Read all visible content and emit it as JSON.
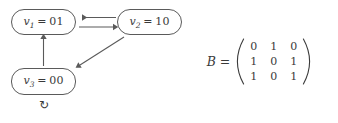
{
  "diagram": {
    "type": "state-transition-graph",
    "nodes": [
      {
        "id": "v1",
        "var": "v",
        "sub": "1",
        "eq": "=",
        "value": "01",
        "label": "v1 = 01"
      },
      {
        "id": "v2",
        "var": "v",
        "sub": "2",
        "eq": "=",
        "value": "10",
        "label": "v2 = 10"
      },
      {
        "id": "v3",
        "var": "v",
        "sub": "3",
        "eq": "=",
        "value": "00",
        "label": "v3 = 00"
      }
    ],
    "edges": [
      {
        "from": "v2",
        "to": "v1",
        "style": "straight-horizontal-upper",
        "direction": "left"
      },
      {
        "from": "v1",
        "to": "v2",
        "style": "straight-horizontal-lower",
        "direction": "right"
      },
      {
        "from": "v3",
        "to": "v1",
        "style": "straight-vertical",
        "direction": "up"
      },
      {
        "from": "v2",
        "to": "v3",
        "style": "diagonal",
        "direction": "down-left"
      },
      {
        "from": "v3",
        "to": "v3",
        "style": "self-loop",
        "direction": "loop"
      }
    ],
    "selfloop_icon": "↻",
    "stroke_color": "#5a5a5a",
    "text_color": "#3a3a3a",
    "background_color": "#ffffff"
  },
  "matrix": {
    "name": "B",
    "equals": "=",
    "rows": [
      [
        "0",
        "1",
        "0"
      ],
      [
        "1",
        "0",
        "1"
      ],
      [
        "1",
        "0",
        "1"
      ]
    ],
    "bracket": "parentheses"
  }
}
